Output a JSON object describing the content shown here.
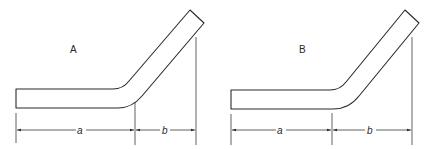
{
  "figures": [
    {
      "label": "A",
      "dimensions": {
        "horizontal": "a",
        "angled": "b"
      }
    },
    {
      "label": "B",
      "dimensions": {
        "horizontal": "a",
        "angled": "b"
      }
    }
  ],
  "colors": {
    "line": "#2a2a2a",
    "background": "#ffffff"
  }
}
